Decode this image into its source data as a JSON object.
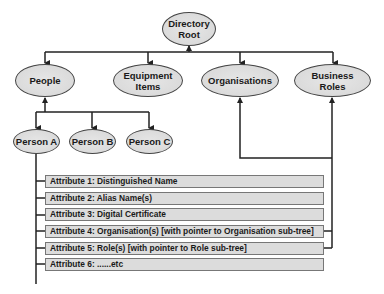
{
  "diagram": {
    "type": "hierarchy",
    "root": {
      "label": "Directory\nRoot"
    },
    "level1": [
      {
        "label": "People"
      },
      {
        "label": "Equipment\nItems"
      },
      {
        "label": "Organisations"
      },
      {
        "label": "Business\nRoles"
      }
    ],
    "people_children": [
      {
        "label": "Person A"
      },
      {
        "label": "Person B"
      },
      {
        "label": "Person C"
      }
    ],
    "attributes": [
      {
        "label": "Attribute 1: Distinguished Name"
      },
      {
        "label": "Attribute 2: Alias Name(s)"
      },
      {
        "label": "Attribute 3: Digital Certificate"
      },
      {
        "label": "Attribute 4: Organisation(s) [with pointer to Organisation sub-tree]"
      },
      {
        "label": "Attribute 5: Role(s) [with pointer to Role sub-tree]"
      },
      {
        "label": "Attribute 6: ......etc"
      }
    ],
    "colors": {
      "node_fill": "#dddddd",
      "line": "#222222",
      "attr_fill": "#dcdcdc"
    }
  }
}
